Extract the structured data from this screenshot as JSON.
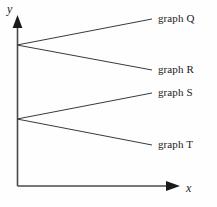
{
  "figure": {
    "background_color": "#fefefe",
    "line_color": "#3a3a3a",
    "axis_color": "#4a4a4a",
    "text_color": "#1a1a1a"
  },
  "axes": {
    "y_label": "y",
    "x_label": "x",
    "origin": {
      "x": 17,
      "y": 186
    },
    "y_axis_top": 17,
    "x_axis_right": 178
  },
  "chart_data": {
    "type": "line",
    "title": "",
    "xlabel": "x",
    "ylabel": "y",
    "grid": false,
    "legend_position": "right-inline",
    "series": [
      {
        "name": "graph Q",
        "label": "graph Q",
        "start": {
          "x": 17,
          "y": 45
        },
        "end": {
          "x": 152,
          "y": 19
        },
        "direction": "increasing",
        "label_x": 158,
        "label_y": 19
      },
      {
        "name": "graph R",
        "label": "graph R",
        "start": {
          "x": 17,
          "y": 45
        },
        "end": {
          "x": 152,
          "y": 70
        },
        "direction": "decreasing",
        "label_x": 158,
        "label_y": 70
      },
      {
        "name": "graph S",
        "label": "graph S",
        "start": {
          "x": 17,
          "y": 119
        },
        "end": {
          "x": 152,
          "y": 93
        },
        "direction": "increasing",
        "label_x": 158,
        "label_y": 93
      },
      {
        "name": "graph T",
        "label": "graph T",
        "start": {
          "x": 17,
          "y": 119
        },
        "end": {
          "x": 152,
          "y": 145
        },
        "direction": "decreasing",
        "label_x": 158,
        "label_y": 145
      }
    ],
    "intercepts": [
      {
        "name": "upper-intercept",
        "x": 17,
        "y": 45
      },
      {
        "name": "lower-intercept",
        "x": 17,
        "y": 119
      }
    ]
  }
}
